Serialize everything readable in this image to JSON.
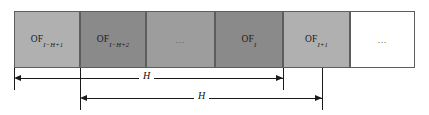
{
  "figure": {
    "type": "diagram",
    "colors": {
      "cell_light": "#b0b0b0",
      "cell_dark": "#8a8a8a",
      "cell_mid": "#9d9d9d",
      "cell_white": "#ffffff",
      "border": "#5d5d5d",
      "ink": "#1a1a1a"
    },
    "cells": [
      {
        "id": "cell-1",
        "base": "OF",
        "sub": "I−H+1",
        "fill": "#b0b0b0",
        "is_ellipsis": false
      },
      {
        "id": "cell-2",
        "base": "OF",
        "sub": "I−H+2",
        "fill": "#8a8a8a",
        "is_ellipsis": false
      },
      {
        "id": "cell-3",
        "base": "…",
        "sub": "",
        "fill": "#9d9d9d",
        "is_ellipsis": true
      },
      {
        "id": "cell-4",
        "base": "OF",
        "sub": "I",
        "fill": "#8a8a8a",
        "is_ellipsis": false
      },
      {
        "id": "cell-5",
        "base": "OF",
        "sub": "I+1",
        "fill": "#b0b0b0",
        "is_ellipsis": false
      },
      {
        "id": "cell-6",
        "base": "…",
        "sub": "",
        "fill": "#ffffff",
        "is_ellipsis": true
      }
    ],
    "spans": [
      {
        "id": "span-1",
        "label": "H"
      },
      {
        "id": "span-2",
        "label": "H"
      }
    ]
  }
}
